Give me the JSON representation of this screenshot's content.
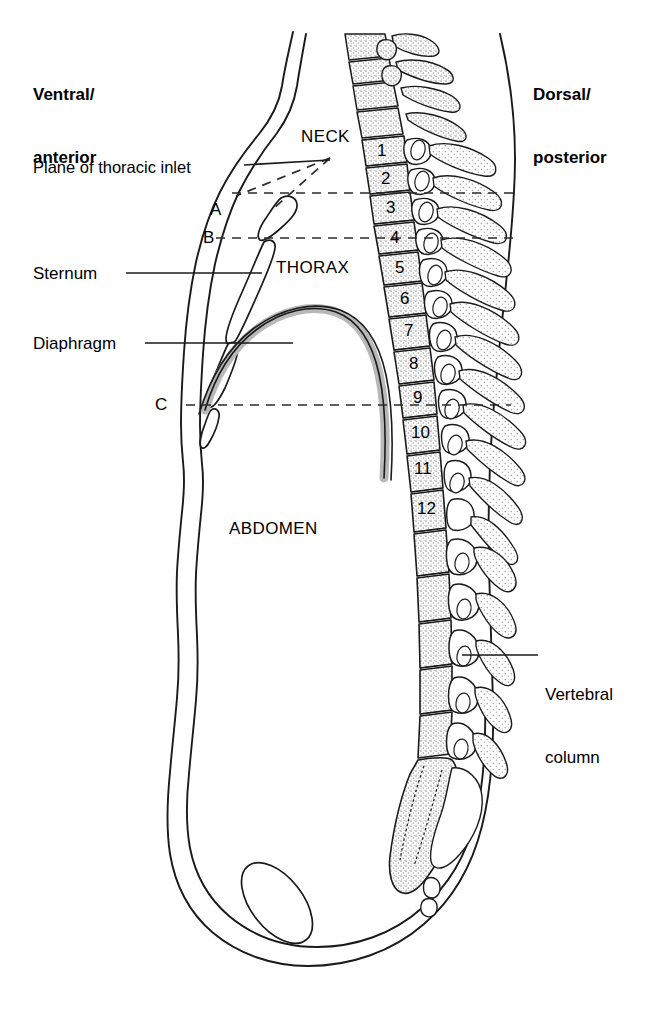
{
  "figure": {
    "kind": "anatomical-sagittal-section"
  },
  "orientation": {
    "left_label": "Ventral/\nanterior",
    "left_label_line1": "Ventral/",
    "left_label_line2": "anterior",
    "right_label_line1": "Dorsal/",
    "right_label_line2": "posterior"
  },
  "regions": [
    {
      "id": "neck",
      "label": "NECK"
    },
    {
      "id": "thorax",
      "label": "THORAX"
    },
    {
      "id": "abdomen",
      "label": "ABDOMEN"
    }
  ],
  "leader_labels": [
    {
      "id": "plane-of-thoracic-inlet",
      "label": "Plane of thoracic inlet"
    },
    {
      "id": "sternum",
      "label": "Sternum"
    },
    {
      "id": "diaphragm",
      "label": "Diaphragm"
    },
    {
      "id": "vertebral-column",
      "label_line1": "Vertebral",
      "label_line2": "column"
    }
  ],
  "plane_markers": [
    {
      "id": "plane-a",
      "label": "A"
    },
    {
      "id": "plane-b",
      "label": "B"
    },
    {
      "id": "plane-c",
      "label": "C"
    }
  ],
  "vertebrae": {
    "series": "thoracic",
    "numbers": [
      "1",
      "2",
      "3",
      "4",
      "5",
      "6",
      "7",
      "8",
      "9",
      "10",
      "11",
      "12"
    ]
  },
  "colors": {
    "outline": "#1a1a1a",
    "bone_fill": "#ffffff",
    "bone_stipple": "#9a9a9a",
    "diaphragm_fill": "#b8b8b8",
    "diaphragm_stroke": "#1a1a1a",
    "dashed_line": "#2b2b2b",
    "background": "#ffffff"
  }
}
